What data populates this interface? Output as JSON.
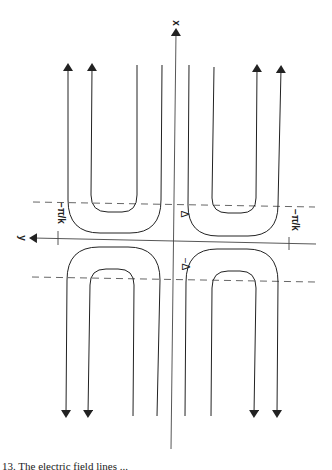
{
  "figure": {
    "axis_labels": {
      "x": "x",
      "y": "y"
    },
    "tick_labels": {
      "left": "−π/k",
      "right": "−π/k"
    },
    "delta_labels": {
      "upper": "Δ",
      "lower": "−Δ"
    },
    "line_color": "#222222",
    "dashed_color": "#555555"
  },
  "caption": {
    "text": "13.  The electric field lines ..."
  }
}
